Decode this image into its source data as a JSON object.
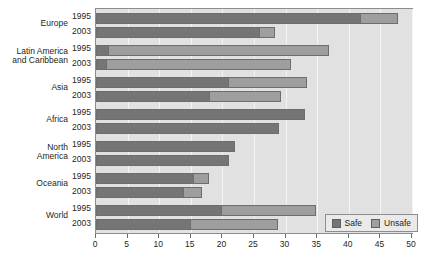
{
  "legend": {
    "position": "bottom-right",
    "items": [
      {
        "label": "Safe",
        "color": "#757575",
        "icon": "square-swatch-icon"
      },
      {
        "label": "Unsafe",
        "color": "#9e9e9e",
        "icon": "square-swatch-icon"
      }
    ]
  },
  "axis": {
    "tick_labels": [
      "0",
      "5",
      "10",
      "15",
      "20",
      "25",
      "30",
      "35",
      "40",
      "45",
      "50"
    ]
  },
  "groups": [
    {
      "name": "Europe",
      "years": [
        "1995",
        "2003"
      ]
    },
    {
      "name": "Latin America\nand Caribbean",
      "years": [
        "1995",
        "2003"
      ]
    },
    {
      "name": "Asia",
      "years": [
        "1995",
        "2003"
      ]
    },
    {
      "name": "Africa",
      "years": [
        "1995",
        "2003"
      ]
    },
    {
      "name": "North\nAmerica",
      "years": [
        "1995",
        "2003"
      ]
    },
    {
      "name": "Oceania",
      "years": [
        "1995",
        "2003"
      ]
    },
    {
      "name": "World",
      "years": [
        "1995",
        "2003"
      ]
    }
  ],
  "chart_data": {
    "type": "bar",
    "orientation": "horizontal",
    "stacked": true,
    "title": "",
    "xlabel": "",
    "ylabel": "",
    "xlim": [
      0,
      50
    ],
    "xticks": [
      0,
      5,
      10,
      15,
      20,
      25,
      30,
      35,
      40,
      45,
      50
    ],
    "grid": true,
    "legend": [
      "Safe",
      "Unsafe"
    ],
    "categories": [
      "Europe 1995",
      "Europe 2003",
      "Latin America and Caribbean 1995",
      "Latin America and Caribbean 2003",
      "Asia 1995",
      "Asia 2003",
      "Africa 1995",
      "Africa 2003",
      "North America 1995",
      "North America 2003",
      "Oceania 1995",
      "Oceania 2003",
      "World 1995",
      "World 2003"
    ],
    "series": [
      {
        "name": "Safe",
        "color": "#757575",
        "values": [
          42.0,
          26.0,
          2.0,
          1.8,
          21.0,
          18.0,
          33.0,
          29.0,
          22.0,
          21.0,
          15.5,
          14.0,
          20.0,
          15.0
        ]
      },
      {
        "name": "Unsafe",
        "color": "#9e9e9e",
        "values": [
          6.0,
          2.5,
          35.0,
          29.2,
          12.5,
          11.5,
          0.0,
          0.0,
          0.0,
          0.0,
          2.5,
          3.0,
          15.0,
          14.0
        ]
      }
    ],
    "totals": [
      48.0,
      28.5,
      37.0,
      31.0,
      33.5,
      29.5,
      33.0,
      29.0,
      22.0,
      21.0,
      18.0,
      17.0,
      35.0,
      29.0
    ]
  }
}
